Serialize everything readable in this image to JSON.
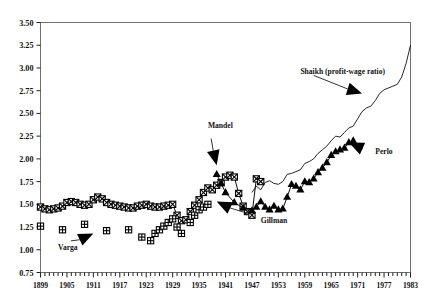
{
  "chart_data": {
    "type": "line",
    "title": "",
    "xlabel": "",
    "ylabel": "",
    "xlim": [
      1899,
      1983
    ],
    "ylim": [
      0.75,
      3.5
    ],
    "grid": false,
    "legend": "none (inline arrow annotations)",
    "yticks": [
      "0.75",
      "1.00",
      "1.25",
      "1.50",
      "1.75",
      "2.00",
      "2.25",
      "2.50",
      "2.75",
      "3.00",
      "3.25",
      "3.50"
    ],
    "xticks": [
      "1899",
      "1905",
      "1911",
      "1917",
      "1923",
      "1929",
      "1935",
      "1941",
      "1947",
      "1953",
      "1959",
      "1965",
      "1971",
      "1977",
      "1983"
    ],
    "xtick_minor_step": 1,
    "annotations": [
      {
        "text": "Shaikh (profit-wage ratio)",
        "x": 1958,
        "y": 2.93,
        "arrow_to_x": 1972,
        "arrow_to_y": 2.72
      },
      {
        "text": "Mandel",
        "x": 1937,
        "y": 2.34,
        "arrow_to_x": 1939,
        "arrow_to_y": 1.93
      },
      {
        "text": "Perlo",
        "x": 1975,
        "y": 2.05,
        "arrow_to_x": 1969,
        "arrow_to_y": 2.18
      },
      {
        "text": "Gillman",
        "x": 1949,
        "y": 1.3,
        "arrow_to_x": 1939,
        "arrow_to_y": 1.53
      },
      {
        "text": "Varga",
        "x": 1903,
        "y": 1.0,
        "arrow_to_x": 1911,
        "arrow_to_y": 1.18
      }
    ],
    "series": [
      {
        "name": "Gillman",
        "marker": "square-with-x",
        "line": true,
        "points": [
          [
            1899,
            1.47
          ],
          [
            1900,
            1.45
          ],
          [
            1901,
            1.44
          ],
          [
            1902,
            1.45
          ],
          [
            1903,
            1.46
          ],
          [
            1904,
            1.48
          ],
          [
            1905,
            1.52
          ],
          [
            1906,
            1.53
          ],
          [
            1907,
            1.52
          ],
          [
            1908,
            1.5
          ],
          [
            1909,
            1.49
          ],
          [
            1910,
            1.5
          ],
          [
            1911,
            1.55
          ],
          [
            1912,
            1.58
          ],
          [
            1913,
            1.56
          ],
          [
            1914,
            1.52
          ],
          [
            1915,
            1.5
          ],
          [
            1916,
            1.49
          ],
          [
            1917,
            1.48
          ],
          [
            1918,
            1.47
          ],
          [
            1919,
            1.46
          ],
          [
            1920,
            1.46
          ],
          [
            1921,
            1.48
          ],
          [
            1922,
            1.49
          ],
          [
            1923,
            1.5
          ],
          [
            1924,
            1.48
          ],
          [
            1925,
            1.47
          ],
          [
            1926,
            1.47
          ],
          [
            1927,
            1.48
          ],
          [
            1928,
            1.49
          ],
          [
            1929,
            1.5
          ],
          [
            1930,
            1.38
          ],
          [
            1931,
            1.32
          ],
          [
            1932,
            1.33
          ],
          [
            1933,
            1.42
          ],
          [
            1934,
            1.49
          ],
          [
            1935,
            1.55
          ],
          [
            1936,
            1.63
          ],
          [
            1937,
            1.68
          ],
          [
            1938,
            1.66
          ],
          [
            1939,
            1.71
          ],
          [
            1940,
            1.74
          ],
          [
            1941,
            1.8
          ],
          [
            1942,
            1.82
          ],
          [
            1943,
            1.8
          ],
          [
            1944,
            1.62
          ],
          [
            1945,
            1.48
          ],
          [
            1946,
            1.42
          ],
          [
            1947,
            1.38
          ],
          [
            1948,
            1.78
          ],
          [
            1949,
            1.75
          ]
        ]
      },
      {
        "name": "Varga",
        "marker": "square-with-plus",
        "line": false,
        "points": [
          [
            1899,
            1.26
          ],
          [
            1904,
            1.22
          ],
          [
            1909,
            1.28
          ],
          [
            1914,
            1.21
          ],
          [
            1919,
            1.22
          ],
          [
            1922,
            1.14
          ],
          [
            1924,
            1.1
          ],
          [
            1925,
            1.18
          ],
          [
            1926,
            1.22
          ],
          [
            1927,
            1.26
          ],
          [
            1928,
            1.3
          ],
          [
            1929,
            1.34
          ],
          [
            1930,
            1.25
          ],
          [
            1931,
            1.18
          ],
          [
            1933,
            1.3
          ],
          [
            1934,
            1.38
          ],
          [
            1935,
            1.44
          ],
          [
            1936,
            1.47
          ],
          [
            1937,
            1.5
          ]
        ]
      },
      {
        "name": "Mandel",
        "marker": "triangle-up",
        "line": true,
        "points": [
          [
            1939,
            1.83
          ],
          [
            1940,
            1.73
          ],
          [
            1941,
            1.63
          ],
          [
            1943,
            1.52
          ],
          [
            1945,
            1.46
          ],
          [
            1947,
            1.43
          ],
          [
            1948,
            1.47
          ],
          [
            1949,
            1.53
          ],
          [
            1950,
            1.47
          ],
          [
            1951,
            1.44
          ],
          [
            1952,
            1.48
          ],
          [
            1953,
            1.44
          ],
          [
            1954,
            1.45
          ],
          [
            1955,
            1.58
          ],
          [
            1956,
            1.72
          ],
          [
            1957,
            1.7
          ],
          [
            1958,
            1.66
          ],
          [
            1959,
            1.75
          ],
          [
            1960,
            1.74
          ],
          [
            1961,
            1.78
          ],
          [
            1962,
            1.85
          ],
          [
            1963,
            1.9
          ],
          [
            1964,
            1.96
          ],
          [
            1965,
            2.04
          ],
          [
            1966,
            2.08
          ],
          [
            1967,
            2.1
          ],
          [
            1968,
            2.12
          ],
          [
            1969,
            2.18
          ],
          [
            1970,
            2.2
          ]
        ]
      },
      {
        "name": "Shaikh (profit-wage ratio)",
        "marker": "none",
        "line": true,
        "points": [
          [
            1947,
            1.63
          ],
          [
            1948,
            1.7
          ],
          [
            1949,
            1.66
          ],
          [
            1950,
            1.74
          ],
          [
            1951,
            1.76
          ],
          [
            1952,
            1.73
          ],
          [
            1953,
            1.72
          ],
          [
            1954,
            1.75
          ],
          [
            1955,
            1.83
          ],
          [
            1956,
            1.84
          ],
          [
            1957,
            1.86
          ],
          [
            1958,
            1.88
          ],
          [
            1959,
            1.95
          ],
          [
            1960,
            1.97
          ],
          [
            1961,
            2.0
          ],
          [
            1962,
            2.06
          ],
          [
            1963,
            2.1
          ],
          [
            1964,
            2.14
          ],
          [
            1965,
            2.2
          ],
          [
            1966,
            2.25
          ],
          [
            1967,
            2.24
          ],
          [
            1968,
            2.29
          ],
          [
            1969,
            2.34
          ],
          [
            1970,
            2.36
          ],
          [
            1971,
            2.44
          ],
          [
            1972,
            2.52
          ],
          [
            1973,
            2.56
          ],
          [
            1974,
            2.58
          ],
          [
            1975,
            2.64
          ],
          [
            1976,
            2.72
          ],
          [
            1977,
            2.76
          ],
          [
            1978,
            2.78
          ],
          [
            1979,
            2.8
          ],
          [
            1980,
            2.82
          ],
          [
            1981,
            2.9
          ],
          [
            1982,
            3.05
          ],
          [
            1983,
            3.25
          ]
        ]
      }
    ]
  }
}
